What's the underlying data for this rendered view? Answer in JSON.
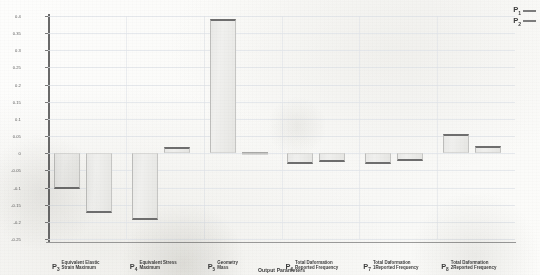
{
  "chart_data": {
    "type": "bar",
    "title": "",
    "xlabel": "Output Parameters",
    "ylabel": "Local sensitivity",
    "ylim": [
      -0.25,
      0.4
    ],
    "grid": true,
    "legend_position": "top-right",
    "yticks": [
      "0.4",
      "0.35",
      "0.3",
      "0.25",
      "0.2",
      "0.15",
      "0.1",
      "0.05",
      "0",
      "-0.05",
      "-0.1",
      "-0.15",
      "-0.2",
      "-0.25"
    ],
    "ytick_values": [
      0.4,
      0.35,
      0.3,
      0.25,
      0.2,
      0.15,
      0.1,
      0.05,
      0,
      -0.05,
      -0.1,
      -0.15,
      -0.2,
      -0.25
    ],
    "categories": [
      "P3 Equivalent Elastic Strain Maximum",
      "P4 Equivalent Stress Maximum",
      "P5 Geometry Mass",
      "P6 Total Daformation Reported Frequency",
      "P7 Total Daformation 1Reported Frequency",
      "P8 Total Daformation 2Reported Frequency"
    ],
    "series": [
      {
        "name": "P1",
        "values": [
          -0.105,
          -0.195,
          0.39,
          -0.03,
          -0.032,
          0.055
        ]
      },
      {
        "name": "P2",
        "values": [
          -0.175,
          0.018,
          0.005,
          -0.027,
          -0.022,
          0.021
        ]
      }
    ]
  },
  "axis": {
    "ylabel": "Local sensitivity",
    "xlabel": "Output Parameters",
    "yticks": [
      "0.4",
      "0.35",
      "0.3",
      "0.25",
      "0.2",
      "0.15",
      "0.1",
      "0.05",
      "0",
      "-0.05",
      "-0.1",
      "-0.15",
      "-0.2",
      "-0.25"
    ]
  },
  "legend": {
    "items": [
      {
        "key": "P",
        "sub": "1"
      },
      {
        "key": "P",
        "sub": "2"
      }
    ]
  },
  "xlabels": [
    {
      "p": "P",
      "sub": "3",
      "text": "Equivalent Elastic\nStrain Maximum"
    },
    {
      "p": "P",
      "sub": "4",
      "text": "Equivalent Stress\nMaximum"
    },
    {
      "p": "P",
      "sub": "5",
      "text": "Geometry\nMass"
    },
    {
      "p": "P",
      "sub": "6",
      "text": "Total Daformation\nReported Frequency"
    },
    {
      "p": "P",
      "sub": "7",
      "text": "Total Daformation\n1Reported Frequency"
    },
    {
      "p": "P",
      "sub": "8",
      "text": "Total Daformation\n2Reported Frequency"
    }
  ]
}
